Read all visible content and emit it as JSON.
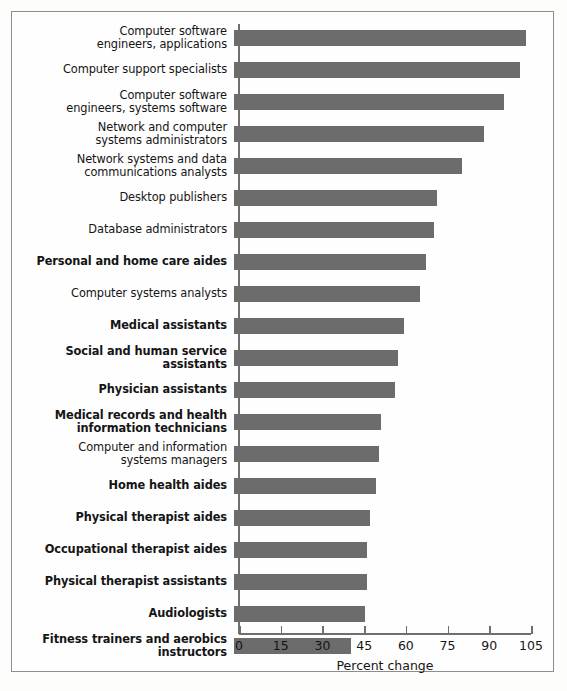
{
  "chart_data": {
    "type": "bar",
    "orientation": "horizontal",
    "title": "",
    "xlabel": "Percent change",
    "ylabel": "",
    "xlim": [
      0,
      105
    ],
    "xticks": [
      0,
      15,
      30,
      45,
      60,
      75,
      90,
      105
    ],
    "grid": false,
    "legend": null,
    "bar_color": "#6c6c6c",
    "categories": [
      "Computer software\nengineers, applications",
      "Computer support specialists",
      "Computer software\nengineers, systems software",
      "Network and computer\nsystems administrators",
      "Network systems and data\ncommunications analysts",
      "Desktop publishers",
      "Database administrators",
      "Personal and home care aides",
      "Computer systems analysts",
      "Medical assistants",
      "Social and human service assistants",
      "Physician assistants",
      "Medical records and health\ninformation technicians",
      "Computer and information\nsystems managers",
      "Home health aides",
      "Physical therapist aides",
      "Occupational therapist aides",
      "Physical therapist assistants",
      "Audiologists",
      "Fitness trainers and aerobics\ninstructors"
    ],
    "values": [
      105,
      103,
      97,
      90,
      82,
      73,
      72,
      69,
      67,
      61,
      59,
      58,
      53,
      52,
      51,
      49,
      48,
      48,
      47,
      42
    ],
    "emphasis": [
      false,
      false,
      false,
      false,
      false,
      false,
      false,
      true,
      false,
      true,
      true,
      true,
      true,
      false,
      true,
      true,
      true,
      true,
      true,
      true
    ]
  },
  "axis": {
    "tick_labels": [
      "0",
      "15",
      "30",
      "45",
      "60",
      "75",
      "90",
      "105"
    ],
    "title": "Percent change"
  }
}
